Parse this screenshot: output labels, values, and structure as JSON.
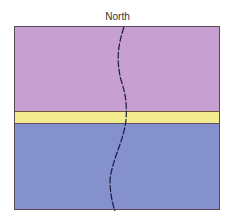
{
  "diagram": {
    "title": "North",
    "layers": [
      {
        "name": "upper-layer",
        "color": "#c79fd0"
      },
      {
        "name": "middle-band",
        "color": "#f3ec90"
      },
      {
        "name": "lower-layer",
        "color": "#8591cd"
      }
    ],
    "line_color": "#1a1a40"
  }
}
